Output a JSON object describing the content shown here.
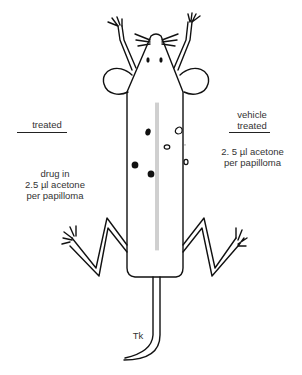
{
  "left_panel": {
    "heading": "treated",
    "line1": "drug in",
    "line2": "2.5 µl acetone",
    "line3": "per papilloma"
  },
  "right_panel": {
    "heading1": "vehicle",
    "heading2": "treated",
    "line1": "2. 5 µl acetone",
    "line2": "per papilloma"
  },
  "tail_label": "Tk",
  "papillomas": {
    "filled_left_side": 4,
    "open_right_side": 4
  }
}
